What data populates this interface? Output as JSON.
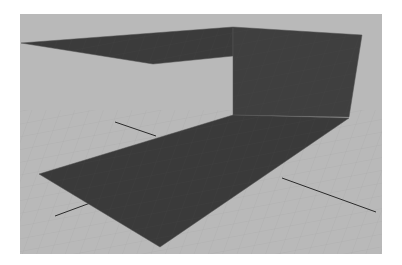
{
  "viewport": {
    "kind": "3d-perspective-viewport",
    "background_color": "#b9b9b9",
    "grid_color": "#adadad",
    "axis_color": "#2a2a2a"
  },
  "scene": {
    "objects": [
      {
        "name": "top-plane",
        "color": "#3b3b3b",
        "points": "21,43 233,27 233,56 153,64"
      },
      {
        "name": "wall-plane",
        "color": "#3f3f3f",
        "points": "233,27 362,35 349,117 233,115"
      },
      {
        "name": "floor-plane",
        "color": "#3a3a3a",
        "points": "39,174 233,115 349,118 160,247"
      }
    ],
    "axis_lines": [
      {
        "name": "axis-line-back",
        "x1": 115,
        "y1": 122,
        "x2": 156,
        "y2": 136
      },
      {
        "name": "axis-line-left",
        "x1": 55,
        "y1": 216,
        "x2": 93,
        "y2": 202
      },
      {
        "name": "axis-line-right",
        "x1": 282,
        "y1": 178,
        "x2": 376,
        "y2": 212
      }
    ]
  }
}
